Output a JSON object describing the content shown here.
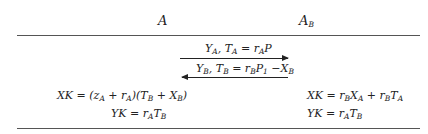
{
  "parties": {
    "left": "A",
    "right_base": "A",
    "right_sub": "B"
  },
  "messages": [
    {
      "direction": "right",
      "text": "Y_A, T_A = r_A P"
    },
    {
      "direction": "left",
      "text": "Y_B, T_B = r_B P_1 − X_B"
    }
  ],
  "left_computations": [
    "XK = (z_A + r_A)(T_B + X_B)",
    "YK = r_A T_B"
  ],
  "right_computations": [
    "XK = r_B X_A + r_B T_A",
    "YK = r_A T_B"
  ],
  "glyphs": {
    "X": "X",
    "Y": "Y",
    "K": "K",
    "T": "T",
    "P": "P",
    "r": "r",
    "z": "z",
    "A": "A",
    "B": "B",
    "one": "1",
    "eq": " = ",
    "plus": " + ",
    "minus": " −",
    "comma": ", ",
    "lp": "(",
    "rp": ")"
  }
}
